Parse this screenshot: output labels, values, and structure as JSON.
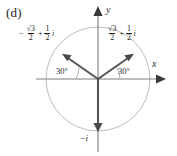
{
  "figure": {
    "part_label": "(d)",
    "axes": {
      "x_label": "x",
      "y_label": "y"
    },
    "circle": {
      "center_x": 98,
      "center_y": 79,
      "radius": 52,
      "stroke_color": "#b9b9b9"
    },
    "vector_color": "#555555",
    "axis_color": "#767676",
    "vectors": [
      {
        "name": "vector-upper-left",
        "angle_deg": 150,
        "label": {
          "sign": "−",
          "real_numerator": "√3",
          "real_denominator": "2",
          "operator": "+",
          "imag_numerator": "1",
          "imag_denominator": "2",
          "imag_unit": "i"
        }
      },
      {
        "name": "vector-upper-right",
        "angle_deg": 30,
        "label": {
          "sign": "",
          "real_numerator": "√3",
          "real_denominator": "2",
          "operator": "+",
          "imag_numerator": "1",
          "imag_denominator": "2",
          "imag_unit": "i"
        }
      },
      {
        "name": "vector-down",
        "angle_deg": 270,
        "label": {
          "sign": "−",
          "imag_unit": "i"
        }
      }
    ],
    "angles": {
      "left_label": "30°",
      "right_label": "30°"
    }
  }
}
